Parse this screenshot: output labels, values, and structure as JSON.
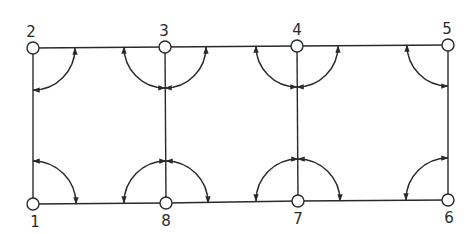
{
  "diagram": {
    "type": "truss-grid",
    "colors": {
      "stroke": "#2a2a2a",
      "background": "#ffffff",
      "node_fill": "#ffffff"
    },
    "nodes": [
      {
        "id": "1",
        "label": "1",
        "x": 33,
        "y": 204,
        "lx": 35,
        "ly": 227
      },
      {
        "id": "2",
        "label": "2",
        "x": 33,
        "y": 48,
        "lx": 31,
        "ly": 37
      },
      {
        "id": "3",
        "label": "3",
        "x": 165,
        "y": 47,
        "lx": 164,
        "ly": 36
      },
      {
        "id": "4",
        "label": "4",
        "x": 297,
        "y": 46,
        "lx": 297,
        "ly": 35
      },
      {
        "id": "5",
        "label": "5",
        "x": 448,
        "y": 45,
        "lx": 447,
        "ly": 34
      },
      {
        "id": "6",
        "label": "6",
        "x": 448,
        "y": 200,
        "lx": 449,
        "ly": 223
      },
      {
        "id": "7",
        "label": "7",
        "x": 298,
        "y": 201,
        "lx": 298,
        "ly": 224
      },
      {
        "id": "8",
        "label": "8",
        "x": 166,
        "y": 203,
        "lx": 166,
        "ly": 226
      }
    ],
    "edges": [
      [
        "2",
        "3"
      ],
      [
        "3",
        "4"
      ],
      [
        "4",
        "5"
      ],
      [
        "1",
        "8"
      ],
      [
        "8",
        "7"
      ],
      [
        "7",
        "6"
      ],
      [
        "1",
        "2"
      ],
      [
        "8",
        "3"
      ],
      [
        "7",
        "4"
      ],
      [
        "6",
        "5"
      ]
    ],
    "angle_arcs": [
      {
        "node": "2",
        "r": 42,
        "quadrants": [
          "right-down"
        ]
      },
      {
        "node": "3",
        "r": 41,
        "quadrants": [
          "left-down",
          "right-down"
        ]
      },
      {
        "node": "4",
        "r": 41,
        "quadrants": [
          "left-down",
          "right-down"
        ]
      },
      {
        "node": "5",
        "r": 41,
        "quadrants": [
          "left-down"
        ]
      },
      {
        "node": "1",
        "r": 43,
        "quadrants": [
          "right-up"
        ]
      },
      {
        "node": "8",
        "r": 42,
        "quadrants": [
          "left-up",
          "right-up"
        ]
      },
      {
        "node": "7",
        "r": 42,
        "quadrants": [
          "left-up",
          "right-up"
        ]
      },
      {
        "node": "6",
        "r": 42,
        "quadrants": [
          "left-up"
        ]
      }
    ]
  }
}
